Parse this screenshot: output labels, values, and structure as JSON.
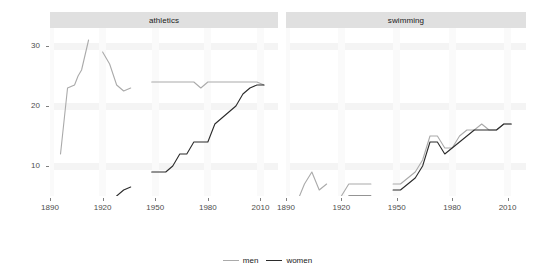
{
  "chart_data": {
    "type": "line",
    "title": "",
    "xlabel": "",
    "ylabel": "",
    "xlim": [
      1890,
      2020
    ],
    "ylim": [
      5,
      33
    ],
    "grid": true,
    "legend_position": "bottom",
    "facet_variable": "sport",
    "facets": [
      {
        "name": "athletics",
        "label": "athletics",
        "xticks": [
          1890,
          1920,
          1950,
          1980,
          2010
        ],
        "yticks": [
          10,
          20,
          30
        ],
        "series": [
          {
            "name": "men",
            "color": "#aaaaaa",
            "segments": [
              {
                "x": [
                  1896,
                  1900,
                  1904,
                  1906,
                  1908,
                  1912
                ],
                "y": [
                  12,
                  23,
                  23.5,
                  25,
                  26,
                  31
                ]
              },
              {
                "x": [
                  1920,
                  1924,
                  1928,
                  1932,
                  1936
                ],
                "y": [
                  29,
                  27,
                  23.5,
                  22.5,
                  23
                ]
              },
              {
                "x": [
                  1948,
                  1952,
                  1956,
                  1960,
                  1964,
                  1968,
                  1972,
                  1976,
                  1980,
                  1984,
                  1988,
                  1992,
                  1996,
                  2000,
                  2004,
                  2008,
                  2012
                ],
                "y": [
                  24,
                  24,
                  24,
                  24,
                  24,
                  24,
                  24,
                  23,
                  24,
                  24,
                  24,
                  24,
                  24,
                  24,
                  24,
                  24,
                  23.5
                ]
              }
            ]
          },
          {
            "name": "women",
            "color": "#2b2b2b",
            "segments": [
              {
                "x": [
                  1928,
                  1932,
                  1936
                ],
                "y": [
                  5,
                  6,
                  6.5
                ]
              },
              {
                "x": [
                  1948,
                  1952,
                  1956,
                  1960,
                  1964,
                  1968,
                  1972,
                  1976,
                  1980,
                  1984,
                  1988,
                  1992,
                  1996,
                  2000,
                  2004,
                  2008,
                  2012
                ],
                "y": [
                  9,
                  9,
                  9,
                  10,
                  12,
                  12,
                  14,
                  14,
                  14,
                  17,
                  18,
                  19,
                  20,
                  22,
                  23,
                  23.5,
                  23.5
                ]
              }
            ]
          }
        ]
      },
      {
        "name": "swimming",
        "label": "swimming",
        "xticks": [
          1890,
          1920,
          1950,
          1980,
          2010
        ],
        "yticks": [
          10,
          20,
          30
        ],
        "series": [
          {
            "name": "men",
            "color": "#aaaaaa",
            "segments": [
              {
                "x": [
                  1896,
                  1900,
                  1904,
                  1908,
                  1912
                ],
                "y": [
                  4,
                  7,
                  9,
                  6,
                  7
                ]
              },
              {
                "x": [
                  1920,
                  1924,
                  1928,
                  1932,
                  1936
                ],
                "y": [
                  5,
                  7,
                  7,
                  7,
                  7
                ]
              },
              {
                "x": [
                  1948,
                  1952,
                  1956,
                  1960,
                  1964,
                  1968,
                  1972,
                  1976,
                  1980,
                  1984,
                  1988,
                  1992,
                  1996,
                  2000,
                  2004,
                  2008,
                  2012
                ],
                "y": [
                  7,
                  7,
                  8,
                  9,
                  11,
                  15,
                  15,
                  13,
                  13,
                  15,
                  16,
                  16,
                  17,
                  16,
                  16,
                  17,
                  17
                ]
              }
            ]
          },
          {
            "name": "women",
            "color": "#2b2b2b",
            "segments": [
              {
                "x": [
                  1920,
                  1924,
                  1928,
                  1932,
                  1936
                ],
                "y": [
                  3,
                  5,
                  5,
                  5,
                  5
                ]
              },
              {
                "x": [
                  1948,
                  1952,
                  1956,
                  1960,
                  1964,
                  1968,
                  1972,
                  1976,
                  1980,
                  1984,
                  1988,
                  1992,
                  1996,
                  2000,
                  2004,
                  2008,
                  2012
                ],
                "y": [
                  6,
                  6,
                  7,
                  8,
                  10,
                  14,
                  14,
                  12,
                  13,
                  14,
                  15,
                  16,
                  16,
                  16,
                  16,
                  17,
                  17
                ]
              }
            ]
          }
        ]
      }
    ],
    "legend": [
      {
        "label": "men",
        "color": "#aaaaaa"
      },
      {
        "label": "women",
        "color": "#2b2b2b"
      }
    ]
  }
}
